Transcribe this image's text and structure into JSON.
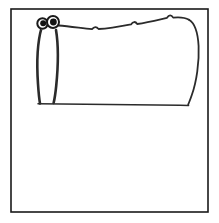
{
  "canvas": {
    "width": 219,
    "height": 223,
    "background_color": "#ffffff",
    "title": "Hand-drawn creature doodle"
  },
  "frame": {
    "label": "Drawing border frame",
    "x": 11,
    "y": 9,
    "width": 197,
    "height": 203,
    "stroke_color": "#1a1a1a",
    "fill_color": "#ffffff"
  },
  "drawing": {
    "name": "creature-sketch",
    "description": "Simple black line drawing of a long-necked creature with two eyes, a tall neck-leg on the left and a large rounded body extending to the right, standing on a ground line",
    "ink_color": "#2b2b2b",
    "parts": {
      "head": {
        "label": "Head",
        "center_x": 48,
        "center_y": 23
      },
      "eye_left": {
        "label": "Left eye",
        "cx": 42.5,
        "cy": 23.5,
        "r": 5.2,
        "pupil_cx": 43.2,
        "pupil_cy": 23.2,
        "pupil_r": 3.0,
        "white_color": "#ffffff",
        "pupil_color": "#141414"
      },
      "eye_right": {
        "label": "Right eye",
        "cx": 53.0,
        "cy": 22.0,
        "r": 6.0,
        "pupil_cx": 53.4,
        "pupil_cy": 22.0,
        "pupil_r": 3.4,
        "white_color": "#ffffff",
        "pupil_color": "#141414"
      },
      "neck_leg": {
        "label": "Neck and front leg",
        "left_path": "M 41.5 28 C 37.5 42 36.5 62 38.0 84 C 38.6 93 39.2 99 40.0 103.5",
        "right_path": "M 56.0 30 C 58.5 45 58.2 66 56.2 86 C 55.4 94 54.6 99 53.6 103.0"
      },
      "back": {
        "label": "Back outline with three bumps",
        "path": "M 58.5 25.5 C 70 26.5 82 28.2 92 29.2 C 94.2 26.6 96.4 26.4 98.6 29.0 C 110 28.6 122 26.2 131 24.4 C 133.0 21.4 135.4 21.2 137.2 24.0 C 148 22.4 159 19.6 167 17.8 C 169.0 14.6 171.4 14.6 173.2 17.6 C 179 17.0 185 17.4 189.0 19.8"
      },
      "rear": {
        "label": "Rear body curve",
        "path": "M 189.0 19.8 C 194.5 23.0 197.8 32 198.6 46 C 199.4 62 196.5 82 191.8 95 C 190.3 99.5 189.0 102.5 188.2 104.6"
      },
      "ground": {
        "label": "Ground line",
        "path": "M 38.0 103.8 C 70 104.0 130 104.9 188.6 105.4"
      }
    },
    "bumps": [
      {
        "label": "bump-1",
        "x": 96,
        "y": 27
      },
      {
        "label": "bump-2",
        "x": 135,
        "y": 22
      },
      {
        "label": "bump-3",
        "x": 171,
        "y": 15
      }
    ]
  }
}
